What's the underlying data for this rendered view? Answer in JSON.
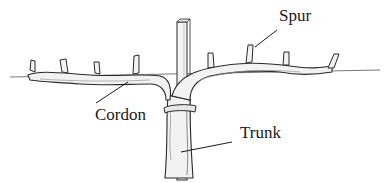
{
  "diagram": {
    "labels": {
      "spur": "Spur",
      "cordon": "Cordon",
      "trunk": "Trunk"
    },
    "colors": {
      "ink": "#2a2a2a",
      "wood_fill": "#f2f2f2",
      "shade": "#9a9a9a",
      "wire": "#555555"
    }
  }
}
